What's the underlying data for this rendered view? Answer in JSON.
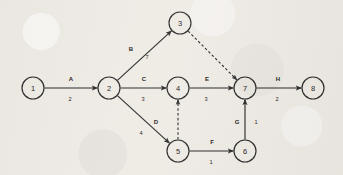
{
  "diagram": {
    "kind": "activity-on-arrow-network-diagram",
    "background_color": "#efebe5",
    "ink_color": "#2b2b2b",
    "nodes": [
      {
        "id": "1",
        "label": "1",
        "cx": 33,
        "cy": 88,
        "r": 11
      },
      {
        "id": "2",
        "label": "2",
        "cx": 109,
        "cy": 88,
        "r": 11
      },
      {
        "id": "3",
        "label": "3",
        "cx": 180,
        "cy": 23,
        "r": 11
      },
      {
        "id": "4",
        "label": "4",
        "cx": 178,
        "cy": 88,
        "r": 11
      },
      {
        "id": "5",
        "label": "5",
        "cx": 178,
        "cy": 151,
        "r": 11
      },
      {
        "id": "6",
        "label": "6",
        "cx": 245,
        "cy": 151,
        "r": 11
      },
      {
        "id": "7",
        "label": "7",
        "cx": 245,
        "cy": 88,
        "r": 11
      },
      {
        "id": "8",
        "label": "8",
        "cx": 313,
        "cy": 88,
        "r": 11
      }
    ],
    "edges": [
      {
        "from": "1",
        "to": "2",
        "activity": "A",
        "duration": "2",
        "style": "solid",
        "activity_pos": [
          71,
          79
        ],
        "duration_pos": [
          70,
          99
        ]
      },
      {
        "from": "2",
        "to": "3",
        "activity": "B",
        "duration": "7",
        "style": "solid",
        "activity_pos": [
          131,
          49
        ],
        "duration_pos": [
          147,
          57
        ]
      },
      {
        "from": "2",
        "to": "4",
        "activity": "C",
        "duration": "3",
        "style": "solid",
        "activity_pos": [
          144,
          79
        ],
        "duration_pos": [
          143,
          99
        ]
      },
      {
        "from": "2",
        "to": "5",
        "activity": "D",
        "duration": "4",
        "style": "solid",
        "activity_pos": [
          156,
          122
        ],
        "duration_pos": [
          141,
          133
        ]
      },
      {
        "from": "4",
        "to": "7",
        "activity": "E",
        "duration": "3",
        "style": "solid",
        "activity_pos": [
          207,
          79
        ],
        "duration_pos": [
          206,
          99
        ]
      },
      {
        "from": "5",
        "to": "6",
        "activity": "F",
        "duration": "1",
        "style": "solid",
        "activity_pos": [
          212,
          142
        ],
        "duration_pos": [
          211,
          162
        ]
      },
      {
        "from": "6",
        "to": "7",
        "activity": "G",
        "duration": "1",
        "style": "solid",
        "activity_pos": [
          237,
          122
        ],
        "duration_pos": [
          256,
          122
        ]
      },
      {
        "from": "7",
        "to": "8",
        "activity": "H",
        "duration": "2",
        "style": "solid",
        "activity_pos": [
          278,
          79
        ],
        "duration_pos": [
          277,
          99
        ]
      },
      {
        "from": "3",
        "to": "7",
        "activity": "",
        "duration": "",
        "style": "dashed",
        "activity_pos": null,
        "duration_pos": null
      },
      {
        "from": "5",
        "to": "4",
        "activity": "",
        "duration": "",
        "style": "dashed",
        "activity_pos": null,
        "duration_pos": null
      }
    ]
  }
}
